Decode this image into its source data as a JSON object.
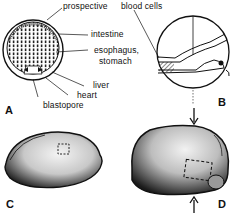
{
  "figure": {
    "panels": [
      {
        "id": "A",
        "label": "A"
      },
      {
        "id": "B",
        "label": "B"
      },
      {
        "id": "C",
        "label": "C"
      },
      {
        "id": "D",
        "label": "D"
      }
    ],
    "annotations": {
      "prospective": "prospective",
      "blood_cells": "blood cells",
      "intestine": "intestine",
      "esophagus_line1": "esophagus,",
      "esophagus_line2": "stomach",
      "liver": "liver",
      "heart": "heart",
      "blastopore": "blastopore"
    },
    "colors": {
      "ink": "#111111",
      "background": "#ffffff",
      "stipple": "#555555"
    }
  }
}
